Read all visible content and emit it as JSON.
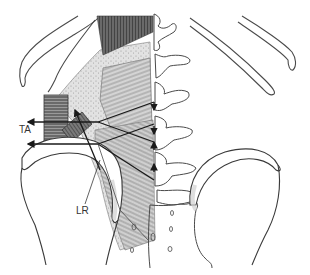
{
  "figure": {
    "labels": {
      "ta": "TA",
      "lr": "LR"
    },
    "colors": {
      "outline": "#3a3a3a",
      "muscle_dark": "#4a4a4a",
      "muscle_mid": "#8a8a8a",
      "fascia_light": "#c8c8c8",
      "shadow": "#d8d8d8",
      "arrow": "#1a1a1a",
      "background": "#ffffff"
    }
  }
}
